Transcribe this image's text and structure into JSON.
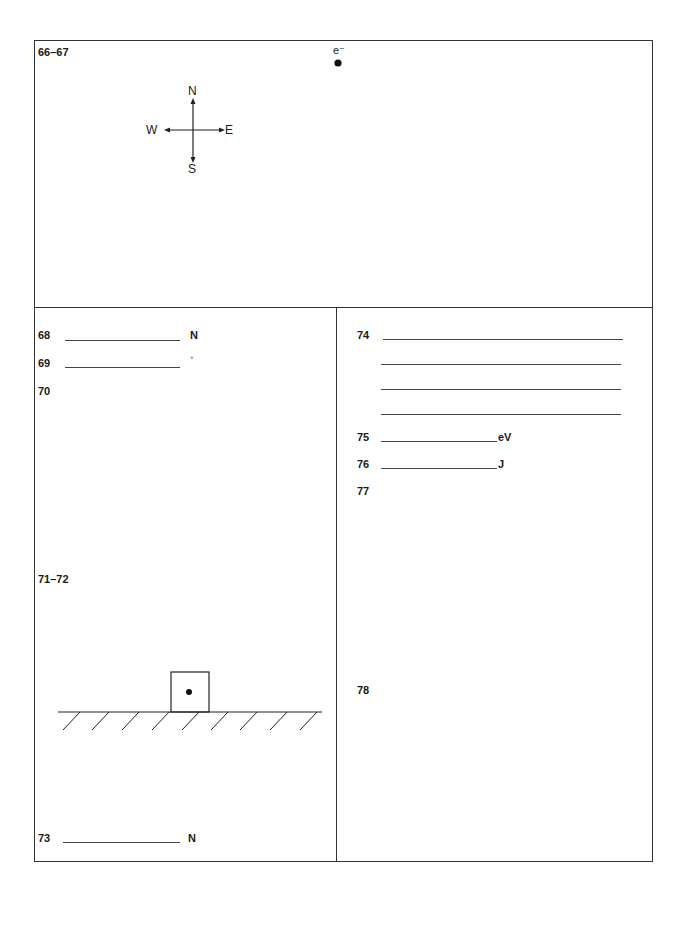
{
  "top_panel": {
    "label": "66–67",
    "electron_label": "e⁻",
    "compass": {
      "north": "N",
      "south": "S",
      "east": "E",
      "west": "W"
    }
  },
  "left_panel": {
    "q68": {
      "number": "68",
      "unit": "N"
    },
    "q69": {
      "number": "69",
      "unit": "°"
    },
    "q70": {
      "number": "70"
    },
    "q71_72": {
      "number": "71–72"
    },
    "q73": {
      "number": "73",
      "unit": "N"
    }
  },
  "right_panel": {
    "q74": {
      "number": "74",
      "answer_lines": 4
    },
    "q75": {
      "number": "75",
      "unit": "eV"
    },
    "q76": {
      "number": "76",
      "unit": "J"
    },
    "q77": {
      "number": "77"
    },
    "q78": {
      "number": "78"
    }
  }
}
